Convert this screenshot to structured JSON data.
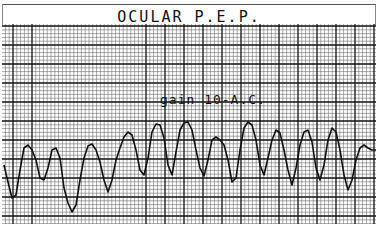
{
  "title": "OCULAR P.E.P.",
  "annotation": "gain 10-A.C.",
  "colors": {
    "grid_minor": "#555555",
    "grid_major": "#111111",
    "trace": "#111111",
    "paper": "#ffffff"
  },
  "chart_data": {
    "type": "line",
    "title": "OCULAR P.E.P.",
    "xlabel": "",
    "ylabel": "",
    "grid": true,
    "annotations": [
      "gain 10-A.C."
    ],
    "axis_ticks": "none (chart-recorder grid paper, no tick labels)",
    "note": "Waveform traced from pixel positions; x and y in screenshot pixel coordinates (y down).",
    "x": [
      4,
      8,
      12,
      16,
      20,
      24,
      28,
      32,
      36,
      40,
      44,
      48,
      52,
      56,
      60,
      64,
      68,
      72,
      76,
      80,
      84,
      88,
      92,
      96,
      100,
      104,
      108,
      112,
      116,
      120,
      124,
      128,
      132,
      136,
      140,
      144,
      148,
      152,
      156,
      160,
      164,
      168,
      172,
      176,
      180,
      184,
      188,
      192,
      196,
      200,
      204,
      208,
      212,
      216,
      220,
      224,
      228,
      232,
      236,
      240,
      244,
      248,
      252,
      256,
      260,
      264,
      268,
      272,
      276,
      280,
      284,
      288,
      292,
      296,
      300,
      304,
      308,
      312,
      316,
      320,
      324,
      328,
      332,
      336,
      340,
      344,
      348,
      352,
      356,
      360,
      364,
      368,
      372,
      376
    ],
    "values": [
      165,
      182,
      198,
      195,
      170,
      148,
      145,
      150,
      160,
      178,
      180,
      168,
      150,
      148,
      158,
      188,
      203,
      212,
      205,
      180,
      158,
      146,
      144,
      150,
      162,
      180,
      192,
      180,
      160,
      148,
      137,
      132,
      135,
      150,
      170,
      175,
      158,
      132,
      124,
      125,
      138,
      165,
      175,
      152,
      130,
      123,
      122,
      130,
      150,
      168,
      176,
      160,
      140,
      137,
      140,
      145,
      160,
      182,
      178,
      150,
      128,
      122,
      125,
      140,
      165,
      175,
      158,
      140,
      130,
      133,
      150,
      170,
      185,
      168,
      145,
      132,
      130,
      142,
      168,
      180,
      165,
      140,
      128,
      132,
      150,
      175,
      190,
      180,
      160,
      148,
      145,
      148,
      150,
      150
    ]
  }
}
